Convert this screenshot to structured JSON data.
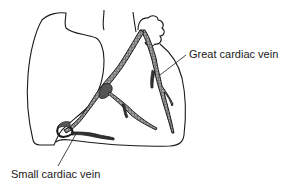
{
  "diagram": {
    "labels": [
      {
        "id": "great",
        "text": "Great cardiac vein"
      },
      {
        "id": "small",
        "text": "Small cardiac vein"
      }
    ],
    "colors": {
      "outline": "#1a1a1a",
      "vein_fill": "#555555",
      "background": "#ffffff"
    }
  }
}
